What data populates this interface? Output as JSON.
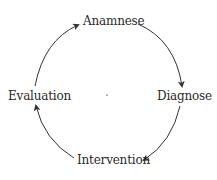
{
  "diagram": {
    "type": "cycle",
    "nodes": [
      {
        "id": "anamnese",
        "label": "Anamnese"
      },
      {
        "id": "diagnose",
        "label": "Diagnose"
      },
      {
        "id": "intervention",
        "label": "Intervention"
      },
      {
        "id": "evaluation",
        "label": "Evaluation"
      }
    ],
    "edges": [
      {
        "from": "anamnese",
        "to": "diagnose"
      },
      {
        "from": "diagnose",
        "to": "intervention"
      },
      {
        "from": "intervention",
        "to": "evaluation"
      },
      {
        "from": "evaluation",
        "to": "anamnese"
      }
    ],
    "center_mark": "·",
    "colors": {
      "text": "#2a2a2a",
      "arrow": "#333333",
      "background": "#ffffff"
    }
  }
}
